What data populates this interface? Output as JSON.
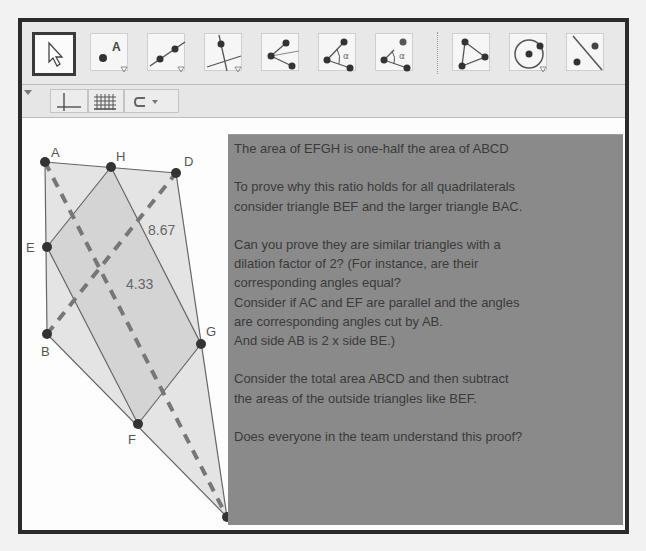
{
  "toolbar": {
    "tools": [
      {
        "name": "move-tool",
        "icon": "cursor-arrow-icon",
        "selected": true
      },
      {
        "name": "point-tool",
        "icon": "point-a-icon",
        "label": "A"
      },
      {
        "name": "line-tool",
        "icon": "line-through-two-points-icon"
      },
      {
        "name": "perpendicular-line-tool",
        "icon": "perpendicular-line-icon"
      },
      {
        "name": "polygon-vertices-tool",
        "icon": "three-points-lines-icon"
      },
      {
        "name": "angle-tool",
        "icon": "angle-icon",
        "label": "α"
      },
      {
        "name": "angle-measure-tool",
        "icon": "angle-points-icon",
        "label": "α"
      },
      {
        "name": "polygon-tool",
        "icon": "triangle-icon"
      },
      {
        "name": "circle-tool",
        "icon": "circle-center-point-icon"
      },
      {
        "name": "reflect-tool",
        "icon": "reflect-about-line-icon"
      }
    ]
  },
  "subbar": {
    "buttons": [
      {
        "name": "axes-toggle",
        "icon": "axes-icon"
      },
      {
        "name": "grid-toggle",
        "icon": "grid-icon"
      },
      {
        "name": "point-capture",
        "icon": "capture-icon"
      }
    ]
  },
  "canvas": {
    "points": [
      {
        "label": "A",
        "x": 45,
        "y": 162
      },
      {
        "label": "H",
        "x": 111,
        "y": 167
      },
      {
        "label": "D",
        "x": 176,
        "y": 173
      },
      {
        "label": "E",
        "x": 47,
        "y": 247
      },
      {
        "label": "B",
        "x": 47,
        "y": 334
      },
      {
        "label": "G",
        "x": 201,
        "y": 344
      },
      {
        "label": "F",
        "x": 138,
        "y": 424
      },
      {
        "label": "C",
        "x": 227,
        "y": 517
      }
    ],
    "measurements": [
      {
        "value": "8.67"
      },
      {
        "value": "4.33"
      }
    ]
  },
  "textbox": {
    "lines": [
      "The area of EFGH is one-half the area of ABCD",
      "",
      "To prove why this ratio holds for all quadrilaterals",
      "consider triangle BEF and the larger triangle BAC.",
      "",
      "Can you prove they are similar triangles with a",
      "dilation factor of 2? (For instance, are their",
      "corresponding angles equal?",
      "Consider if AC and EF are parallel and the angles",
      "are corresponding angles cut by AB.",
      "And side AB is 2 x side BE.)",
      "",
      "Consider the total area ABCD and then subtract",
      "the areas of the outside triangles like BEF.",
      "",
      "Does everyone in the team understand this proof?"
    ]
  },
  "colors": {
    "frame": "#2b2b2b",
    "textbox_bg": "#8a8a8a",
    "quad_fill": "#e2e2e2",
    "inner_fill": "#d6d6d6",
    "diagonal": "#7a7a7a"
  }
}
